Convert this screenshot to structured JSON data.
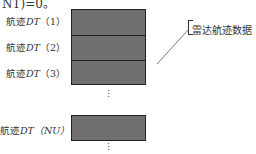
{
  "fragment_text": "NT)=0。",
  "rows": [
    {
      "label_prefix": "航迹",
      "label_var": "DT",
      "label_index": "（1）"
    },
    {
      "label_prefix": "航迹",
      "label_var": "DT",
      "label_index": "（2）"
    },
    {
      "label_prefix": "航迹",
      "label_var": "DT",
      "label_index": "（3）"
    }
  ],
  "last_row": {
    "label_prefix": "航迹",
    "label_var": "DT",
    "label_index": "（NU）"
  },
  "ellipsis": "⋮",
  "callout": {
    "text": "雷达航迹数据"
  },
  "colors": {
    "fill": "#707070",
    "border": "#222222",
    "text": "#333333"
  }
}
